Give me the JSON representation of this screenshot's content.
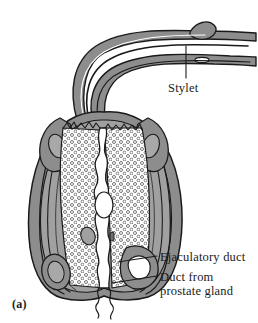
{
  "figure": {
    "panel_label": "(a)",
    "background_color": "#ffffff",
    "ink_color": "#1a1a1a",
    "tissue_fill": "#8d8d8d",
    "tissue_fill_light": "#a8a8a8",
    "lumen_fill": "#ffffff",
    "stipple_color": "#555555"
  },
  "labels": [
    {
      "id": "stylet",
      "text": "Stylet",
      "x": 168,
      "y": 81
    },
    {
      "id": "ejac",
      "text": "Ejaculatory duct",
      "x": 160,
      "y": 250
    },
    {
      "id": "prost1",
      "text": "Duct from",
      "x": 160,
      "y": 270
    },
    {
      "id": "prost2",
      "text": "prostate gland",
      "x": 160,
      "y": 283
    }
  ],
  "leaders": [
    {
      "id": "leader-stylet",
      "from": [
        186,
        46
      ],
      "to": [
        186,
        78
      ]
    },
    {
      "id": "leader-ejac",
      "from": [
        118,
        262
      ],
      "to": [
        157,
        256
      ]
    },
    {
      "id": "leader-duct",
      "from": [
        112,
        283
      ],
      "to": [
        157,
        276
      ]
    }
  ],
  "structures": [
    {
      "id": "stylet-tube",
      "name": "stylet"
    },
    {
      "id": "spicule-sheath",
      "name": "spicule sheath"
    },
    {
      "id": "bursa-wall",
      "name": "muscular bulb wall"
    },
    {
      "id": "glandular-tissue",
      "name": "stippled glandular tissue"
    },
    {
      "id": "central-duct",
      "name": "ejaculatory duct lumen"
    },
    {
      "id": "prostate-duct",
      "name": "duct from prostate gland"
    }
  ]
}
